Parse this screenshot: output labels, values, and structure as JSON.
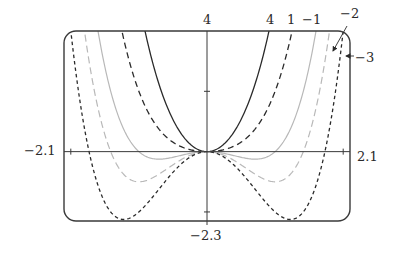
{
  "chart_data": {
    "type": "line",
    "title": "",
    "function": "f(x) = x^4 + c*x^2",
    "xlabel": "",
    "ylabel": "",
    "xlim": [
      -2.1,
      2.1
    ],
    "ylim": [
      -2.3,
      4
    ],
    "grid": false,
    "legend": "inline labels at top right",
    "axis_labels": {
      "x_min": "−2.1",
      "x_max": "2.1",
      "y_min": "−2.3",
      "y_max": "4"
    },
    "y_ticks": [
      -2,
      2
    ],
    "x_ticks": [
      -2,
      2
    ],
    "series": [
      {
        "name": "4",
        "c": 4,
        "label": "4",
        "stroke": "#2a2a2a",
        "dash": "",
        "width": 1.3
      },
      {
        "name": "1",
        "c": 1,
        "label": "1",
        "stroke": "#2a2a2a",
        "dash": "6,4",
        "width": 1.3
      },
      {
        "name": "-1",
        "c": -1,
        "label": "−1",
        "stroke": "#b8b8b8",
        "dash": "",
        "width": 1.2
      },
      {
        "name": "-2",
        "c": -2,
        "label": "−2",
        "stroke": "#b8b8b8",
        "dash": "7,4",
        "width": 1.2
      },
      {
        "name": "-3",
        "c": -3,
        "label": "−3",
        "stroke": "#2a2a2a",
        "dash": "3.5,3",
        "width": 1.3
      }
    ],
    "annotations": [
      {
        "text": "−2",
        "arrow": true
      },
      {
        "text": "−3",
        "arrow": true
      }
    ]
  },
  "layout": {
    "frame": {
      "x0": 64,
      "y0": 31,
      "x1": 350,
      "y1": 221,
      "radius": 12
    },
    "colors": {
      "axis": "#3a3a3a",
      "frame": "#3a3a3a",
      "text": "#2a2a2a"
    }
  }
}
